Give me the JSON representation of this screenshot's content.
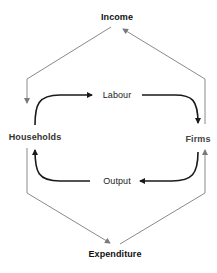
{
  "diagram": {
    "type": "circular-flow",
    "nodes": {
      "income": "Income",
      "households": "Households",
      "firms": "Firms",
      "expenditure": "Expenditure"
    },
    "inner_flows": {
      "labour": "Labour",
      "output": "Output"
    },
    "colors": {
      "inner_arrows": "#1a1a1a",
      "outer_arrows": "#808080",
      "text": "#222222"
    }
  }
}
